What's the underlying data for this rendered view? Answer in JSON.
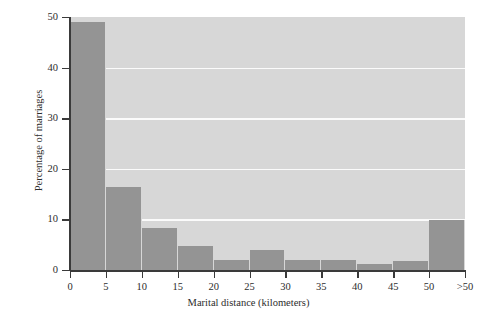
{
  "chart_data": {
    "type": "bar",
    "title": "",
    "subtitle": "",
    "xlabel": "Marital distance (kilometers)",
    "ylabel": "Percentage of marriages",
    "categories": [
      "0-5",
      "5-10",
      "10-15",
      "15-20",
      "20-25",
      "25-30",
      "30-35",
      "35-40",
      "40-45",
      "45-50",
      ">50"
    ],
    "values": [
      49.1,
      16.4,
      8.3,
      4.8,
      2.0,
      3.9,
      1.9,
      1.9,
      1.2,
      1.8,
      9.8
    ],
    "xtick_labels": [
      "0",
      "5",
      "10",
      "15",
      "20",
      "25",
      "30",
      "35",
      "40",
      "45",
      "50",
      ">50"
    ],
    "ytick_labels": [
      "0",
      "10",
      "20",
      "30",
      "40",
      "50"
    ],
    "ytick_values": [
      0,
      10,
      20,
      30,
      40,
      50
    ],
    "ylim": [
      0,
      50
    ],
    "xlim": [
      0,
      11
    ],
    "grid": "horizontal",
    "gridline_values": [
      10,
      20,
      30,
      40
    ],
    "legend": "none",
    "bar_color": "#949494",
    "plot_background_color": "#d7d7d7",
    "gridline_color": "#fbfbfb",
    "axis_color": "#3a3a3a",
    "figure_background_color": "#ffffff"
  }
}
